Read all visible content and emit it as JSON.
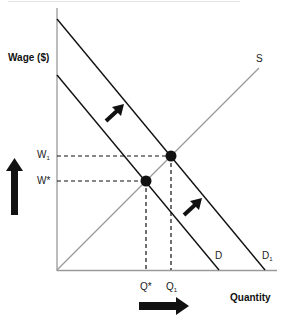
{
  "diagram": {
    "y_axis_label": "Wage ($)",
    "x_axis_label": "Quantity",
    "curves": {
      "supply": {
        "label": "S",
        "color": "#9a9a9a"
      },
      "demand": {
        "label": "D",
        "color": "#111111"
      },
      "demand_shifted": {
        "label": "D",
        "subscript": "1",
        "color": "#111111"
      }
    },
    "y_ticks": {
      "w1": {
        "label": "W",
        "subscript": "1"
      },
      "wstar": {
        "label": "W*"
      }
    },
    "x_ticks": {
      "qstar": {
        "label": "Q*"
      },
      "q1": {
        "label": "Q",
        "subscript": "1"
      }
    },
    "equilibria": [
      {
        "name": "initial",
        "wage": "W*",
        "quantity": "Q*"
      },
      {
        "name": "new",
        "wage": "W1",
        "quantity": "Q1"
      }
    ],
    "arrows": {
      "demand_shift_upper": "right-up",
      "demand_shift_lower": "right-up",
      "wage_increase": "up",
      "quantity_increase": "right"
    }
  }
}
